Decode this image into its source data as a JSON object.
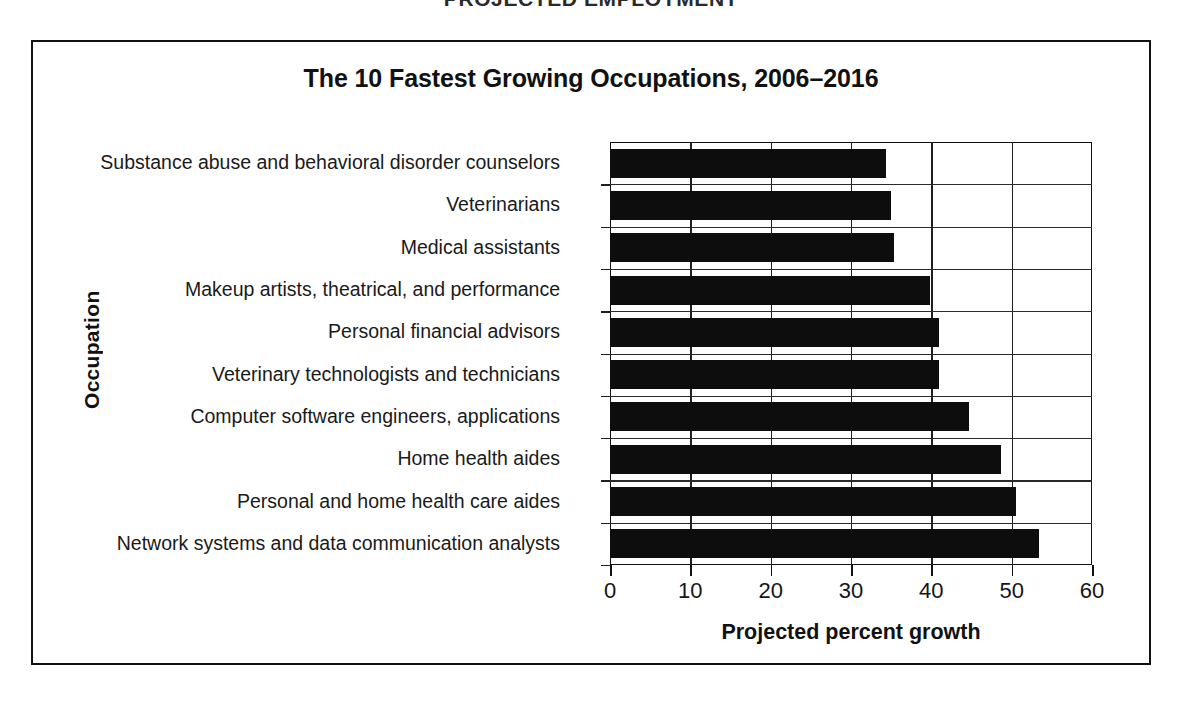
{
  "page": {
    "header": "PROJECTED EMPLOYMENT"
  },
  "figure": {
    "title": "The 10 Fastest Growing Occupations, 2006–2016",
    "x_axis_title": "Projected percent growth",
    "y_axis_title": "Occupation"
  },
  "chart_data": {
    "type": "bar",
    "orientation": "horizontal",
    "title": "The 10 Fastest Growing Occupations, 2006–2016",
    "xlabel": "Projected percent growth",
    "ylabel": "Occupation",
    "xlim": [
      0,
      60
    ],
    "xticks": [
      0,
      10,
      20,
      30,
      40,
      50,
      60
    ],
    "xtick_labels": [
      "0",
      "10",
      "20",
      "30",
      "40",
      "50",
      "60"
    ],
    "grid": "vertical-and-horizontal",
    "legend": "none",
    "bar_color": "#0d0d0d",
    "categories": [
      "Substance abuse and behavioral disorder counselors",
      "Veterinarians",
      "Medical assistants",
      "Makeup artists, theatrical, and performance",
      "Personal financial advisors",
      "Veterinary technologists and technicians",
      "Computer software engineers, applications",
      "Home health aides",
      "Personal and home health care aides",
      "Network systems and data communication analysts"
    ],
    "values": [
      34.3,
      35.0,
      35.4,
      39.8,
      41.0,
      41.0,
      44.7,
      48.7,
      50.6,
      53.4
    ]
  }
}
